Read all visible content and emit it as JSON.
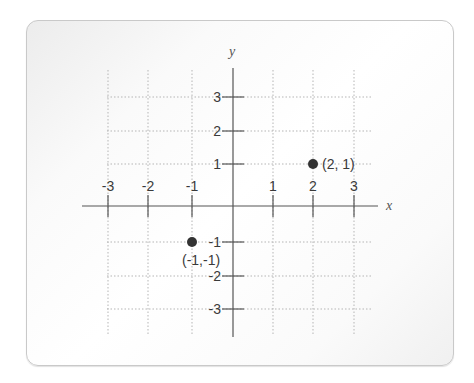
{
  "chart_data": {
    "type": "scatter",
    "title": "",
    "xlabel": "x",
    "ylabel": "y",
    "xlim": [
      -3,
      3
    ],
    "ylim": [
      -3,
      3
    ],
    "grid": true,
    "x_ticks": [
      "-3",
      "-2",
      "-1",
      "1",
      "2",
      "3"
    ],
    "y_ticks": [
      "3",
      "2",
      "1",
      "-1",
      "-2",
      "-3"
    ],
    "points": [
      {
        "x": 2,
        "y": 1,
        "label": "(2, 1)"
      },
      {
        "x": -1,
        "y": -1,
        "label": "(-1,-1)"
      }
    ]
  },
  "colors": {
    "axis": "#555555",
    "grid": "#b5b5b5",
    "point": "#333333"
  }
}
